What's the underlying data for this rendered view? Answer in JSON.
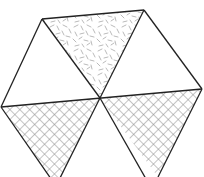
{
  "diagram": {
    "type": "hexagon-of-triangles",
    "stroke_color": "#222222",
    "pattern_color": "#9a9a9a",
    "triangles": [
      {
        "position": "top",
        "fill": "random-dashes"
      },
      {
        "position": "upper-left",
        "fill": "none"
      },
      {
        "position": "upper-right",
        "fill": "none"
      },
      {
        "position": "lower-left",
        "fill": "crosshatch"
      },
      {
        "position": "lower-right",
        "fill": "crosshatch"
      },
      {
        "position": "bottom",
        "fill": "none"
      }
    ]
  }
}
